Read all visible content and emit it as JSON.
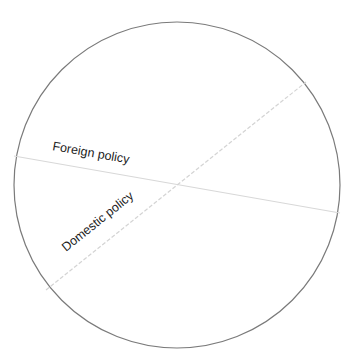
{
  "diagram": {
    "circle": {
      "cx": 177,
      "cy": 185,
      "r": 163,
      "stroke": "#7a7a7a"
    },
    "axes": [
      {
        "label": "Foreign policy",
        "style": "solid",
        "color": "#d8d8d8",
        "x1": 14,
        "y1": 156,
        "x2": 340,
        "y2": 213
      },
      {
        "label": "Domestic policy",
        "style": "dashed",
        "color": "#d4d4d4",
        "x1": 46,
        "y1": 290,
        "x2": 306,
        "y2": 82
      }
    ]
  }
}
